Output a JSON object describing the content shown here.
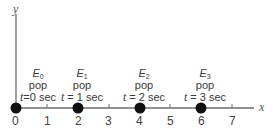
{
  "axes": {
    "x_label": "x",
    "y_label": "y",
    "ticks": [
      "0",
      "1",
      "2",
      "3",
      "4",
      "5",
      "6",
      "7"
    ]
  },
  "events": [
    {
      "name": "E",
      "sub": "0",
      "word": "pop",
      "t_var": "t",
      "t_text": "=0 sec",
      "x": 0
    },
    {
      "name": "E",
      "sub": "1",
      "word": "pop",
      "t_var": "t",
      "t_text": " = 1 sec",
      "x": 2
    },
    {
      "name": "E",
      "sub": "2",
      "word": "pop",
      "t_var": "t",
      "t_text": " = 2 sec",
      "x": 4
    },
    {
      "name": "E",
      "sub": "3",
      "word": "pop",
      "t_var": "t",
      "t_text": " = 3 sec",
      "x": 6
    }
  ],
  "colors": {
    "axis": "#6e6e6e",
    "dot": "#111111",
    "text": "#3a3a3a"
  }
}
